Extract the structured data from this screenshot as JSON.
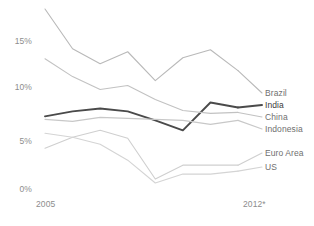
{
  "chart_data": {
    "type": "line",
    "title": "",
    "subtitle": "",
    "xlabel": "",
    "ylabel": "",
    "grid": false,
    "legend_position": "right",
    "x": [
      "2005",
      "2006",
      "2007",
      "2008",
      "2009",
      "2010",
      "2011",
      "2012*"
    ],
    "xtick_labels": [
      "2005",
      "2012*"
    ],
    "ytick_labels": [
      "0%",
      "5%",
      "10%",
      "15%"
    ],
    "ytick_values": [
      0,
      5,
      10,
      15
    ],
    "ylim": [
      -1,
      17.5
    ],
    "series": [
      {
        "name": "Brazil",
        "color": "#b9b9b9",
        "width": 1.1,
        "values": [
          17.2,
          13.2,
          11.7,
          12.9,
          10.0,
          12.3,
          13.1,
          11.0
        ]
      },
      {
        "name": "India",
        "color": "#4a4a4a",
        "width": 1.9,
        "values": [
          6.4,
          6.9,
          7.2,
          6.9,
          6.0,
          5.0,
          7.8,
          7.3
        ]
      },
      {
        "name": "China",
        "color": "#c2c2c2",
        "width": 1.1,
        "values": [
          12.2,
          10.4,
          9.1,
          9.5,
          8.1,
          7.0,
          6.7,
          6.8
        ]
      },
      {
        "name": "Indonesia",
        "color": "#c8c8c8",
        "width": 1.1,
        "values": [
          6.1,
          5.9,
          6.3,
          6.2,
          6.1,
          6.0,
          5.6,
          6.0
        ]
      },
      {
        "name": "Euro Area",
        "color": "#cfcfcf",
        "width": 1.1,
        "values": [
          3.2,
          4.3,
          5.0,
          4.2,
          0.1,
          1.5,
          1.5,
          1.5
        ]
      },
      {
        "name": "US",
        "color": "#d4d4d4",
        "width": 1.1,
        "values": [
          4.7,
          4.3,
          3.6,
          2.0,
          -0.3,
          0.6,
          0.6,
          0.9
        ]
      }
    ]
  },
  "legend": {
    "entries": [
      {
        "label": "Brazil"
      },
      {
        "label": "India"
      },
      {
        "label": "China"
      },
      {
        "label": "Indonesia"
      },
      {
        "label": "Euro Area"
      },
      {
        "label": "US"
      }
    ]
  },
  "axes": {
    "y": [
      {
        "label": "15%",
        "top": 36
      },
      {
        "label": "10%",
        "top": 82
      },
      {
        "label": "5%",
        "top": 136
      },
      {
        "label": "0%",
        "top": 184
      }
    ],
    "x": [
      {
        "label": "2005",
        "left": 36
      },
      {
        "label": "2012*",
        "left": 243
      }
    ]
  }
}
